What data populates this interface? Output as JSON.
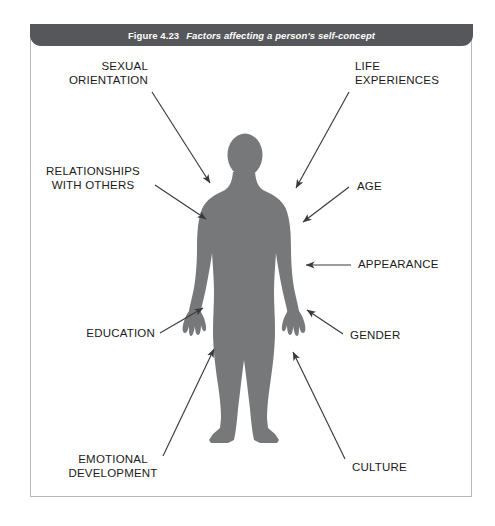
{
  "figure": {
    "number": "Figure 4.23",
    "title": "Factors affecting a person's self-concept",
    "banner_color": "#55575a",
    "silhouette_color": "#76787a",
    "arrow_color": "#3a3a3a",
    "frame_color": "#b9b9b9",
    "background_color": "#ffffff"
  },
  "factors": [
    {
      "id": "sexual-orientation",
      "label": "SEXUAL\nORIENTATION",
      "align": "right",
      "side": "left"
    },
    {
      "id": "life-experiences",
      "label": "LIFE\nEXPERIENCES",
      "align": "left",
      "side": "right"
    },
    {
      "id": "relationships",
      "label": "RELATIONSHIPS\nWITH OTHERS",
      "align": "center",
      "side": "left"
    },
    {
      "id": "age",
      "label": "AGE",
      "align": "left",
      "side": "right"
    },
    {
      "id": "appearance",
      "label": "APPEARANCE",
      "align": "left",
      "side": "right"
    },
    {
      "id": "education",
      "label": "EDUCATION",
      "align": "right",
      "side": "left"
    },
    {
      "id": "gender",
      "label": "GENDER",
      "align": "left",
      "side": "right"
    },
    {
      "id": "emotional-development",
      "label": "EMOTIONAL\nDEVELOPMENT",
      "align": "center",
      "side": "left"
    },
    {
      "id": "culture",
      "label": "CULTURE",
      "align": "left",
      "side": "right"
    }
  ]
}
